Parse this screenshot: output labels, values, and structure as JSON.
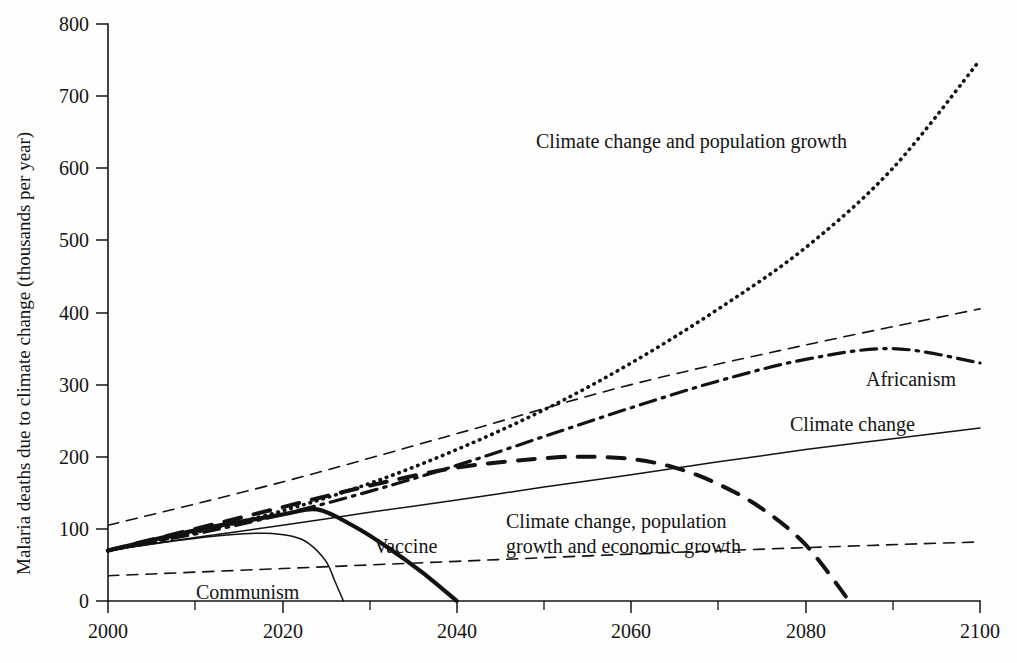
{
  "chart_data": {
    "type": "line",
    "title": "",
    "xlabel": "",
    "ylabel": "Malaria deaths due to climate change (thousands per year)",
    "xlim": [
      2000,
      2100
    ],
    "ylim": [
      0,
      800
    ],
    "x_ticks": [
      2000,
      2020,
      2040,
      2060,
      2080,
      2100
    ],
    "x_minor_ticks": [
      2010,
      2030,
      2050,
      2070,
      2090
    ],
    "y_ticks": [
      0,
      100,
      200,
      300,
      400,
      500,
      600,
      700,
      800
    ],
    "grid": false,
    "legend_position": "inline-annotations",
    "series": [
      {
        "name": "Climate change and population growth",
        "style": "dotted",
        "label_x": 2060,
        "label_y": 655,
        "x": [
          2000,
          2010,
          2020,
          2030,
          2040,
          2050,
          2060,
          2070,
          2080,
          2090,
          2100
        ],
        "values": [
          70,
          95,
          125,
          163,
          210,
          265,
          330,
          405,
          490,
          600,
          750
        ]
      },
      {
        "name": "Africanism",
        "style": "dash-dot",
        "label_x": 2087,
        "label_y": 312,
        "x": [
          2000,
          2010,
          2020,
          2030,
          2040,
          2050,
          2060,
          2070,
          2080,
          2090,
          2100
        ],
        "values": [
          70,
          93,
          120,
          152,
          188,
          228,
          268,
          305,
          335,
          350,
          330
        ]
      },
      {
        "name": "Climate change",
        "style": "thin-solid",
        "label_x": 2079,
        "label_y": 255,
        "x": [
          2000,
          2010,
          2020,
          2030,
          2040,
          2050,
          2060,
          2070,
          2080,
          2090,
          2100
        ],
        "values": [
          70,
          88,
          105,
          123,
          140,
          158,
          175,
          193,
          210,
          225,
          240
        ]
      },
      {
        "name": "Climate change, population growth and economic growth",
        "style": "thick-dashed",
        "label_line1": "Climate change, population",
        "label_line2": "growth and economic growth",
        "label_x": 2049,
        "label_y": 135,
        "x": [
          2000,
          2010,
          2020,
          2030,
          2040,
          2050,
          2055,
          2060,
          2065,
          2070,
          2075,
          2080,
          2085
        ],
        "values": [
          70,
          100,
          130,
          160,
          185,
          198,
          200,
          197,
          185,
          162,
          128,
          78,
          0
        ]
      },
      {
        "name": "Vaccine",
        "style": "thick-solid",
        "label_x": 2034,
        "label_y": 108,
        "x": [
          2000,
          2010,
          2020,
          2024,
          2028,
          2032,
          2036,
          2040
        ],
        "values": [
          70,
          98,
          120,
          127,
          105,
          75,
          40,
          0
        ]
      },
      {
        "name": "Communism",
        "style": "thin-solid",
        "label_x": 2019,
        "label_y": 24,
        "x": [
          2000,
          2008,
          2014,
          2018,
          2021,
          2023,
          2025,
          2026,
          2027
        ],
        "values": [
          70,
          84,
          92,
          94,
          90,
          80,
          55,
          28,
          0
        ]
      },
      {
        "name": "upper-bound-dashed",
        "style": "thin-dashed",
        "x": [
          2000,
          2020,
          2040,
          2060,
          2080,
          2100
        ],
        "values": [
          105,
          165,
          232,
          300,
          355,
          405
        ]
      },
      {
        "name": "lower-bound-dashed",
        "style": "thin-dashed",
        "x": [
          2000,
          2020,
          2040,
          2060,
          2080,
          2100
        ],
        "values": [
          35,
          45,
          55,
          65,
          74,
          82
        ]
      }
    ]
  },
  "labels": {
    "y_axis_title": "Malaria deaths due to climate change (thousands per year)",
    "series_climate_pop": "Climate change and population growth",
    "series_africanism": "Africanism",
    "series_climate_change": "Climate change",
    "series_cpe_line1": "Climate change, population",
    "series_cpe_line2": "growth and economic growth",
    "series_vaccine": "Vaccine",
    "series_communism": "Communism",
    "tick_y_800": "800",
    "tick_y_700": "700",
    "tick_y_600": "600",
    "tick_y_500": "500",
    "tick_y_400": "400",
    "tick_y_300": "300",
    "tick_y_200": "200",
    "tick_y_100": "100",
    "tick_y_0": "0",
    "tick_x_2000": "2000",
    "tick_x_2020": "2020",
    "tick_x_2040": "2040",
    "tick_x_2060": "2060",
    "tick_x_2080": "2080",
    "tick_x_2100": "2100"
  },
  "colors": {
    "background": "#fdfdfc",
    "ink": "#141414",
    "axis": "#151515"
  }
}
